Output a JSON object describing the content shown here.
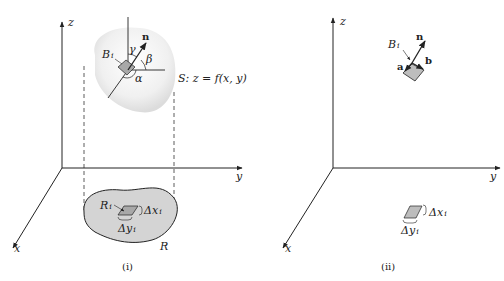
{
  "panel_i": {
    "caption": "(i)",
    "axis_z": "z",
    "axis_y": "y",
    "axis_x": "x",
    "surface_label": "S: z = f(x, y)",
    "patch_label": "B",
    "patch_sub": "i",
    "normal_label": "n",
    "angle_alpha": "α",
    "angle_beta": "β",
    "angle_gamma": "γ",
    "region_label": "R",
    "subregion_label": "R",
    "subregion_sub": "i",
    "dx_label": "Δx",
    "dx_sub": "i",
    "dy_label": "Δy",
    "dy_sub": "i"
  },
  "panel_ii": {
    "caption": "(ii)",
    "axis_z": "z",
    "axis_y": "y",
    "axis_x": "x",
    "patch_label": "B",
    "patch_sub": "i",
    "normal_label": "n",
    "vec_a": "a",
    "vec_b": "b",
    "dx_label": "Δx",
    "dx_sub": "i",
    "dy_label": "Δy",
    "dy_sub": "i"
  },
  "colors": {
    "surface_fill": "#eeeeee",
    "region_fill": "#d4d4d4",
    "patch_fill": "#bdbdbd",
    "line": "#222222"
  }
}
